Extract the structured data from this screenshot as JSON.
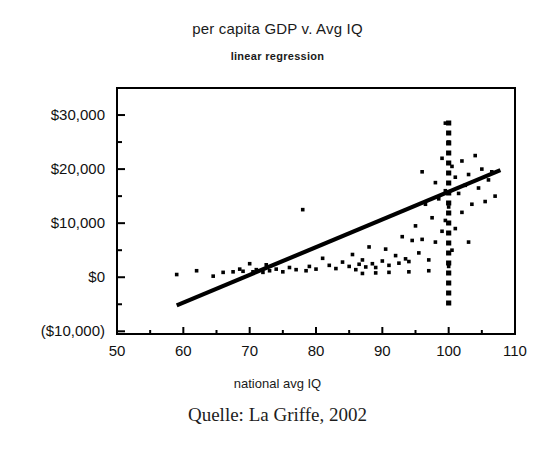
{
  "chart_data": {
    "type": "scatter",
    "title": "per capita GDP v. Avg IQ",
    "subtitle": "linear regression",
    "xlabel": "national avg IQ",
    "ylabel": "",
    "xlim": [
      50,
      110
    ],
    "ylim": [
      -10000,
      35000
    ],
    "grid": false,
    "legend": "none",
    "xticks": [
      50,
      60,
      70,
      80,
      90,
      100,
      110
    ],
    "xtick_labels": [
      "50",
      "60",
      "70",
      "80",
      "90",
      "100",
      "110"
    ],
    "x_minor_tick_step": 5,
    "yticks": [
      30000,
      20000,
      10000,
      0,
      -10000
    ],
    "ytick_labels": [
      "$30,000",
      "$20,000",
      "$10,000",
      "$0",
      "($10,000)"
    ],
    "y_minor_tick_step": 5000,
    "series": [
      {
        "name": "countries",
        "type": "scatter",
        "marker": "square",
        "color": "#000000",
        "points": [
          [
            59.0,
            500
          ],
          [
            62.0,
            1200
          ],
          [
            64.5,
            200
          ],
          [
            66.0,
            900
          ],
          [
            67.5,
            1000
          ],
          [
            68.5,
            1500
          ],
          [
            69.0,
            1100
          ],
          [
            70.0,
            2500
          ],
          [
            70.5,
            1000
          ],
          [
            71.0,
            1400
          ],
          [
            72.0,
            900
          ],
          [
            72.5,
            2300
          ],
          [
            73.0,
            1200
          ],
          [
            74.0,
            1500
          ],
          [
            75.0,
            1000
          ],
          [
            76.0,
            1800
          ],
          [
            77.0,
            1400
          ],
          [
            78.0,
            12500
          ],
          [
            78.5,
            1200
          ],
          [
            79.0,
            2000
          ],
          [
            80.0,
            1500
          ],
          [
            81.0,
            3500
          ],
          [
            82.0,
            2200
          ],
          [
            83.0,
            1600
          ],
          [
            84.0,
            2800
          ],
          [
            85.0,
            2000
          ],
          [
            85.5,
            4200
          ],
          [
            86.0,
            1400
          ],
          [
            86.5,
            2400
          ],
          [
            87.0,
            3200
          ],
          [
            87.5,
            1900
          ],
          [
            88.0,
            5600
          ],
          [
            88.5,
            2500
          ],
          [
            89.0,
            1800
          ],
          [
            90.0,
            3000
          ],
          [
            90.5,
            5200
          ],
          [
            91.0,
            2200
          ],
          [
            92.0,
            4000
          ],
          [
            92.5,
            2600
          ],
          [
            93.0,
            7500
          ],
          [
            93.5,
            3400
          ],
          [
            94.0,
            2900
          ],
          [
            94.5,
            6800
          ],
          [
            95.0,
            9500
          ],
          [
            95.5,
            4500
          ],
          [
            96.0,
            19500
          ],
          [
            96.5,
            13500
          ],
          [
            97.0,
            3200
          ],
          [
            97.5,
            11000
          ],
          [
            98.0,
            17500
          ],
          [
            98.0,
            6500
          ],
          [
            98.5,
            14500
          ],
          [
            99.0,
            22000
          ],
          [
            99.0,
            8500
          ],
          [
            99.5,
            16000
          ],
          [
            99.5,
            10500
          ],
          [
            100.0,
            25000
          ],
          [
            100.0,
            13000
          ],
          [
            100.5,
            20500
          ],
          [
            100.5,
            5000
          ],
          [
            101.0,
            18500
          ],
          [
            101.0,
            9000
          ],
          [
            101.5,
            15500
          ],
          [
            102.0,
            21500
          ],
          [
            102.0,
            12000
          ],
          [
            102.5,
            17000
          ],
          [
            103.0,
            19000
          ],
          [
            103.5,
            13500
          ],
          [
            104.0,
            22500
          ],
          [
            104.5,
            16500
          ],
          [
            105.0,
            20000
          ],
          [
            105.5,
            14000
          ],
          [
            106.0,
            18000
          ],
          [
            107.0,
            15000
          ],
          [
            100.0,
            2000
          ],
          [
            97.0,
            1200
          ],
          [
            94.0,
            1000
          ],
          [
            91.0,
            900
          ],
          [
            89.0,
            800
          ],
          [
            87.0,
            700
          ],
          [
            99.5,
            28500
          ],
          [
            96.0,
            7000
          ],
          [
            103.0,
            6500
          ],
          [
            106.5,
            19500
          ]
        ]
      },
      {
        "name": "regression line",
        "type": "line",
        "color": "#000000",
        "x_start": 59.0,
        "y_start": -5200,
        "x_end": 107.8,
        "y_end": 19800,
        "slope_per_iq": 512,
        "intercept": -35400
      },
      {
        "name": "reference line IQ 100",
        "type": "vline",
        "style": "dashed",
        "color": "#000000",
        "x": 100,
        "y_from": -5500,
        "y_to": 29000
      }
    ]
  },
  "figure": {
    "caption": "Quelle: La Griffe, 2002",
    "frame_color": "#000000",
    "background": "#ffffff"
  }
}
